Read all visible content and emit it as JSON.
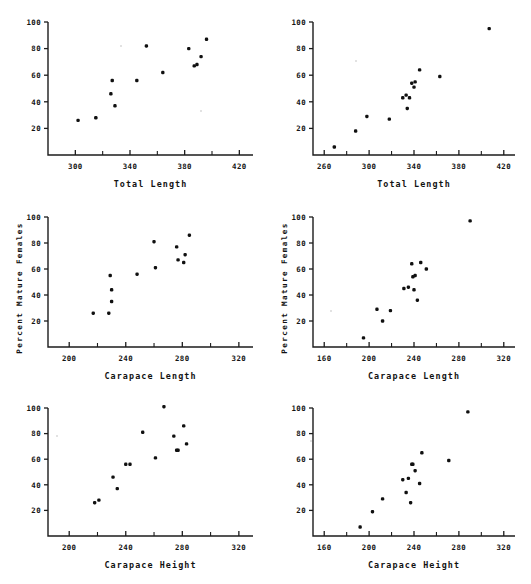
{
  "figure": {
    "panel_count": 6,
    "marker_color": "#101010",
    "axis_color": "#1c1c1c",
    "background": "#ffffff"
  },
  "chart_data": [
    {
      "id": "top-left",
      "type": "scatter",
      "title": "",
      "xlabel": "Total Length",
      "ylabel": "",
      "xlim": [
        280,
        430
      ],
      "ylim": [
        0,
        100
      ],
      "xticks": [
        300,
        340,
        380,
        420
      ],
      "xticklabels": [
        "300",
        "340",
        "380",
        "420"
      ],
      "xminorticks": [
        320,
        360,
        400
      ],
      "yticks": [
        20,
        40,
        60,
        80,
        100
      ],
      "yticklabels": [
        "20",
        "40",
        "60",
        "80",
        "100"
      ],
      "grid": false,
      "legend": "none",
      "x": [
        302,
        315,
        327,
        326,
        329,
        345,
        352,
        364,
        383,
        387,
        389,
        392,
        396
      ],
      "y": [
        26,
        28,
        56,
        46,
        37,
        56,
        82,
        62,
        80,
        67,
        68,
        74,
        87
      ]
    },
    {
      "id": "top-right",
      "type": "scatter",
      "title": "",
      "xlabel": "Total Length",
      "ylabel": "",
      "xlim": [
        250,
        430
      ],
      "ylim": [
        0,
        100
      ],
      "xticks": [
        260,
        300,
        340,
        380,
        420
      ],
      "xticklabels": [
        "260",
        "300",
        "340",
        "380",
        "420"
      ],
      "xminorticks": [
        280,
        320,
        360,
        400
      ],
      "yticks": [
        20,
        40,
        60,
        80,
        100
      ],
      "yticklabels": [
        "20",
        "40",
        "60",
        "80",
        "100"
      ],
      "grid": false,
      "legend": "none",
      "x": [
        269,
        288,
        298,
        318,
        330,
        333,
        334,
        336,
        338,
        340,
        341,
        345,
        363,
        407
      ],
      "y": [
        6,
        18,
        29,
        27,
        43,
        45,
        35,
        43,
        54,
        51,
        55,
        64,
        59,
        95
      ]
    },
    {
      "id": "middle-left",
      "type": "scatter",
      "title": "",
      "xlabel": "Carapace Length",
      "ylabel": "Percent  Mature  Females",
      "xlim": [
        185,
        330
      ],
      "ylim": [
        0,
        100
      ],
      "xticks": [
        200,
        240,
        280,
        320
      ],
      "xticklabels": [
        "200",
        "240",
        "280",
        "320"
      ],
      "xminorticks": [
        220,
        260,
        300
      ],
      "yticks": [
        20,
        40,
        60,
        80,
        100
      ],
      "yticklabels": [
        "20",
        "40",
        "60",
        "80",
        "100"
      ],
      "grid": false,
      "legend": "none",
      "x": [
        217,
        228,
        229,
        230,
        230,
        248,
        260,
        261,
        276,
        277,
        281,
        282,
        285
      ],
      "y": [
        26,
        26,
        55,
        44,
        35,
        56,
        81,
        61,
        77,
        67,
        65,
        71,
        86
      ]
    },
    {
      "id": "middle-right",
      "type": "scatter",
      "title": "",
      "xlabel": "Carapace Length",
      "ylabel": "Percent  Mature  Females",
      "xlim": [
        150,
        330
      ],
      "ylim": [
        0,
        100
      ],
      "xticks": [
        160,
        200,
        240,
        280,
        320
      ],
      "xticklabels": [
        "160",
        "200",
        "240",
        "280",
        "320"
      ],
      "xminorticks": [
        180,
        220,
        260,
        300
      ],
      "yticks": [
        20,
        40,
        60,
        80,
        100
      ],
      "yticklabels": [
        "20",
        "40",
        "60",
        "80",
        "100"
      ],
      "grid": false,
      "legend": "none",
      "x": [
        195,
        207,
        212,
        219,
        231,
        235,
        238,
        239,
        240,
        241,
        243,
        246,
        251,
        290
      ],
      "y": [
        7,
        29,
        20,
        28,
        45,
        46,
        64,
        54,
        44,
        55,
        36,
        65,
        60,
        97
      ]
    },
    {
      "id": "bottom-left",
      "type": "scatter",
      "title": "",
      "xlabel": "Carapace Height",
      "ylabel": "",
      "xlim": [
        185,
        330
      ],
      "ylim": [
        0,
        100
      ],
      "xticks": [
        200,
        240,
        280,
        320
      ],
      "xticklabels": [
        "200",
        "240",
        "280",
        "320"
      ],
      "xminorticks": [
        220,
        260,
        300
      ],
      "yticks": [
        20,
        40,
        60,
        80,
        100
      ],
      "yticklabels": [
        "20",
        "40",
        "60",
        "80",
        "100"
      ],
      "grid": false,
      "legend": "none",
      "x": [
        218,
        221,
        231,
        234,
        240,
        243,
        252,
        261,
        267,
        274,
        276,
        277,
        281,
        283
      ],
      "y": [
        26,
        28,
        46,
        37,
        56,
        56,
        81,
        61,
        101,
        78,
        67,
        67,
        86,
        72
      ]
    },
    {
      "id": "bottom-right",
      "type": "scatter",
      "title": "",
      "xlabel": "Carapace Height",
      "ylabel": "",
      "xlim": [
        150,
        330
      ],
      "ylim": [
        0,
        100
      ],
      "xticks": [
        160,
        200,
        240,
        280,
        320
      ],
      "xticklabels": [
        "160",
        "200",
        "240",
        "280",
        "320"
      ],
      "xminorticks": [
        180,
        220,
        260,
        300
      ],
      "yticks": [
        20,
        40,
        60,
        80,
        100
      ],
      "yticklabels": [
        "20",
        "40",
        "60",
        "80",
        "100"
      ],
      "grid": false,
      "legend": "none",
      "x": [
        192,
        203,
        212,
        230,
        233,
        235,
        237,
        238,
        239,
        241,
        245,
        247,
        271,
        288
      ],
      "y": [
        7,
        19,
        29,
        44,
        34,
        45,
        26,
        56,
        56,
        51,
        41,
        65,
        59,
        97
      ]
    }
  ]
}
